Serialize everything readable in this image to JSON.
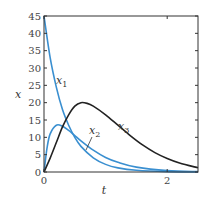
{
  "chart_data": {
    "type": "line",
    "title": "",
    "xlabel": "t",
    "ylabel": "x",
    "xlim": [
      0,
      2.5
    ],
    "ylim": [
      0,
      45
    ],
    "xticks": [
      0,
      2
    ],
    "xtick_labels": [
      "0",
      "2"
    ],
    "yticks": [
      0,
      5,
      10,
      15,
      20,
      25,
      30,
      35,
      40,
      45
    ],
    "ytick_labels": [
      "0",
      "5",
      "10",
      "15",
      "20",
      "25",
      "30",
      "35",
      "40",
      "45"
    ],
    "grid": false,
    "legend": "inline labels",
    "series": [
      {
        "name": "x1",
        "label": "x",
        "subscript": "1",
        "color": "#3a8fd0",
        "x": [
          0,
          0.1,
          0.2,
          0.3,
          0.4,
          0.5,
          0.6,
          0.8,
          1.0,
          1.2,
          1.5,
          2.0,
          2.5
        ],
        "y": [
          45,
          33,
          24.5,
          18,
          13.5,
          10,
          7.4,
          4.1,
          2.2,
          1.2,
          0.5,
          0.1,
          0
        ]
      },
      {
        "name": "x2",
        "label": "x",
        "subscript": "2",
        "color": "#3a8fd0",
        "x": [
          0,
          0.05,
          0.1,
          0.2,
          0.3,
          0.4,
          0.5,
          0.6,
          0.8,
          1.0,
          1.2,
          1.5,
          2.0,
          2.5
        ],
        "y": [
          0,
          7,
          11,
          13.5,
          13.2,
          12,
          10.5,
          9,
          6.3,
          4.2,
          2.8,
          1.4,
          0.4,
          0.1
        ]
      },
      {
        "name": "x3",
        "label": "x",
        "subscript": "3",
        "color": "#222222",
        "x": [
          0,
          0.1,
          0.2,
          0.3,
          0.4,
          0.5,
          0.6,
          0.7,
          0.8,
          1.0,
          1.2,
          1.4,
          1.6,
          1.8,
          2.0,
          2.2,
          2.5
        ],
        "y": [
          0,
          4,
          8.5,
          13,
          16.5,
          19,
          20,
          19.8,
          19,
          16.5,
          13.5,
          10.5,
          7.8,
          5.6,
          3.9,
          2.6,
          1.2
        ]
      }
    ]
  }
}
